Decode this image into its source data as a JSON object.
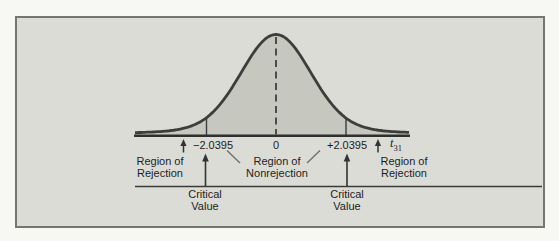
{
  "chart_data": {
    "type": "area",
    "distribution_axis_symbol": "t",
    "degrees_of_freedom": "31",
    "x_ticks": [
      "−2.0395",
      "0",
      "+2.0395"
    ],
    "critical_values": [
      -2.0395,
      2.0395
    ],
    "center_value": 0,
    "regions": [
      {
        "line1": "Region of",
        "line2": "Rejection"
      },
      {
        "line1": "Region of",
        "line2": "Nonrejection"
      },
      {
        "line1": "Region of",
        "line2": "Rejection"
      }
    ],
    "annotations": [
      "Critical Value",
      "Critical Value"
    ],
    "legend": "none",
    "grid": "off"
  },
  "figure": {
    "ticks": {
      "left": "−2.0395",
      "center": "0",
      "right": "+2.0395"
    },
    "axis": {
      "symbol": "t",
      "subscript": "31"
    },
    "regions": {
      "left": {
        "line1": "Region of",
        "line2": "Rejection"
      },
      "center": {
        "line1": "Region of",
        "line2": "Nonrejection"
      },
      "right": {
        "line1": "Region of",
        "line2": "Rejection"
      }
    },
    "critical": {
      "line1": "Critical",
      "line2": "Value"
    },
    "colors": {
      "page_bg": "#f7f7f4",
      "box_bg": "#dcdcd7",
      "box_border": "#75756f",
      "curve_stroke": "#3d3d3b",
      "curve_fill": "#c6c8c0",
      "text": "#1c1c1c"
    }
  }
}
